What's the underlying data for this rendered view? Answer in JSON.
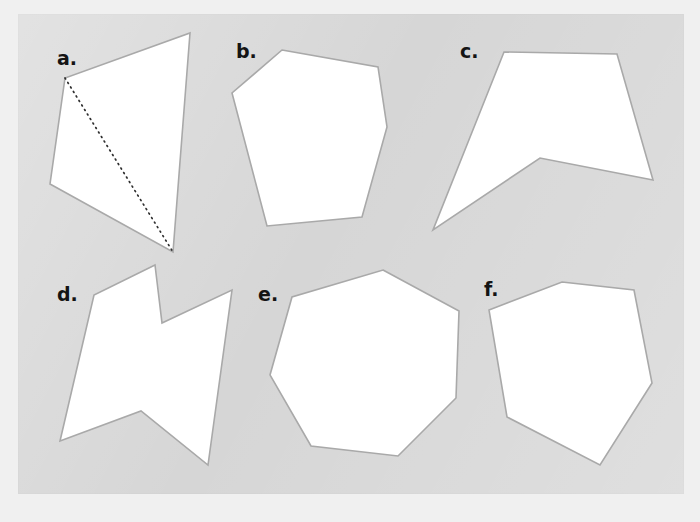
{
  "page": {
    "page_background_color": "#f0f0f0",
    "panel_background_color": "#d6d6d6",
    "shape_fill_color": "#ffffff",
    "shape_outline_color": "#a9a9a9",
    "label_color": "#141414",
    "dotted_line_color": "#2f2f2f",
    "ghost_top_text": "",
    "ghost_mid_text": ""
  },
  "panel": {
    "x": 18,
    "y": 14,
    "width": 666,
    "height": 480
  },
  "figures": [
    {
      "id": "figure-a",
      "label": "a.",
      "label_x": 57,
      "label_y": 49,
      "sides": 4,
      "shape_name": "quadrilateral",
      "points": "190,33 173,252 50,184 65,78",
      "has_dotted_diagonal": true,
      "dotted_diagonal": "65,78 173,252"
    },
    {
      "id": "figure-b",
      "label": "b.",
      "label_x": 236,
      "label_y": 42,
      "sides": 6,
      "shape_name": "hexagon",
      "points": "282,50 378,67 387,127 362,217 267,226 232,93",
      "has_dotted_diagonal": false,
      "dotted_diagonal": ""
    },
    {
      "id": "figure-c",
      "label": "c.",
      "label_x": 460,
      "label_y": 42,
      "sides": 5,
      "shape_name": "concave pentagon",
      "points": "504,52 617,54 653,180 540,158 433,230",
      "has_dotted_diagonal": false,
      "dotted_diagonal": ""
    },
    {
      "id": "figure-d",
      "label": "d.",
      "label_x": 57,
      "label_y": 285,
      "sides": 7,
      "shape_name": "concave heptagon",
      "points": "155,265 162,323 232,290 208,465 141,411 60,441 94,295",
      "has_dotted_diagonal": false,
      "dotted_diagonal": ""
    },
    {
      "id": "figure-e",
      "label": "e.",
      "label_x": 258,
      "label_y": 285,
      "sides": 7,
      "shape_name": "heptagon",
      "points": "383,270 459,311 456,398 398,456 311,446 270,375 292,297"
    },
    {
      "id": "figure-f",
      "label": "f.",
      "label_x": 484,
      "label_y": 280,
      "sides": 6,
      "shape_name": "hexagon",
      "points": "562,282 634,290 652,383 600,465 507,417 489,310",
      "has_dotted_diagonal": false,
      "dotted_diagonal": ""
    }
  ]
}
